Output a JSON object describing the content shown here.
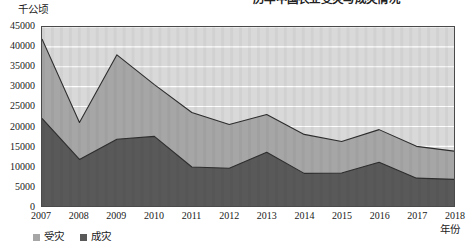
{
  "top_caption": {
    "text": "历年中国农业受灾与成灾情况",
    "note": "clipped-at-top-edge"
  },
  "axis": {
    "y_unit_label": "千公顷",
    "x_title": "年份",
    "y_ticks": [
      "0",
      "5000",
      "10000",
      "15000",
      "20000",
      "25000",
      "30000",
      "35000",
      "40000",
      "45000"
    ]
  },
  "legend": {
    "position": "bottom-left",
    "entries": [
      {
        "label": "受灾",
        "color": "#a6a6a6"
      },
      {
        "label": "成灾",
        "color": "#595959"
      }
    ]
  },
  "colors": {
    "series_shouzai_fill": "#a6a6a6",
    "series_chengzai_fill": "#595959",
    "plot_background": "#d9d9d9",
    "gridline": "#ffffff",
    "border": "#4a4a4a",
    "text": "#1a1a1a"
  },
  "chart_data": {
    "type": "area",
    "title": "历年中国农业受灾与成灾情况",
    "subtitle": "",
    "xlabel": "年份",
    "ylabel": "千公顷",
    "ylim": [
      0,
      45000
    ],
    "ytick_step": 5000,
    "grid": true,
    "legend_position": "bottom-left",
    "stacked": false,
    "categories": [
      "2007",
      "2008",
      "2009",
      "2010",
      "2011",
      "2012",
      "2013",
      "2014",
      "2015",
      "2016",
      "2017",
      "2018"
    ],
    "series": [
      {
        "name": "受灾",
        "color": "#a6a6a6",
        "values": [
          42000,
          21000,
          38000,
          30500,
          23500,
          20500,
          23000,
          18000,
          16200,
          19200,
          15000,
          13800
        ]
      },
      {
        "name": "成灾",
        "color": "#595959",
        "values": [
          22000,
          11700,
          16800,
          17500,
          9800,
          9500,
          13500,
          8200,
          8300,
          11000,
          7000,
          6700
        ]
      }
    ]
  }
}
